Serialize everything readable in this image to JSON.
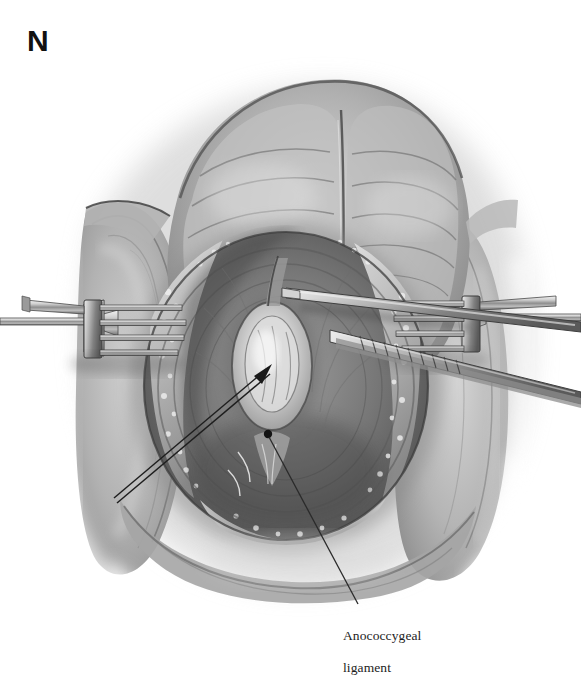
{
  "figure": {
    "panel_letter": "N",
    "type": "medical-illustration",
    "medium": "grayscale wash / pencil rendering",
    "background_color": "#ffffff",
    "ink_color": "#1c1c1c",
    "tone_range": [
      "#ffffff",
      "#f0f0f0",
      "#d6d6d6",
      "#b8b8b8",
      "#9a9a9a",
      "#7d7d7d",
      "#5e5e5e",
      "#3f3f3f",
      "#222222"
    ]
  },
  "annotations": {
    "ligament_label": {
      "line1": "Anococcygeal",
      "line2": "ligament",
      "x": 343,
      "y": 612
    }
  },
  "leaders": [
    {
      "name": "anal-canal-leader",
      "style": "double-line-with-arrowhead",
      "from_x": 114,
      "from_y": 498,
      "to_x": 272,
      "to_y": 364,
      "color": "#1e1e1e"
    },
    {
      "name": "anococcygeal-ligament-leader",
      "style": "single-line-with-dot",
      "from_x": 268,
      "from_y": 434,
      "to_x": 358,
      "to_y": 604,
      "color": "#2a2a2a",
      "marker": "dot"
    }
  ],
  "instruments": [
    {
      "name": "left-rake-retractor",
      "prongs": 4,
      "orientation": "handle-to-left",
      "x": 8,
      "y": 300
    },
    {
      "name": "right-rake-retractor",
      "prongs": 4,
      "orientation": "handle-to-right",
      "x": 400,
      "y": 300
    },
    {
      "name": "right-forceps",
      "detail": "ribbed-handle forceps crossing diagonally from upper right to center",
      "x": 290,
      "y": 290
    }
  ],
  "anatomy": [
    {
      "name": "buttocks-fold-upper",
      "region": "top"
    },
    {
      "name": "left-thigh",
      "region": "left"
    },
    {
      "name": "right-thigh",
      "region": "right"
    },
    {
      "name": "perineal-wound-margin",
      "region": "center-oval"
    },
    {
      "name": "anal-canal",
      "region": "center",
      "appearance": "pale elongated oval"
    },
    {
      "name": "anococcygeal-ligament",
      "region": "center-inferior"
    },
    {
      "name": "fat-subcutaneous",
      "region": "wound-edges"
    }
  ]
}
